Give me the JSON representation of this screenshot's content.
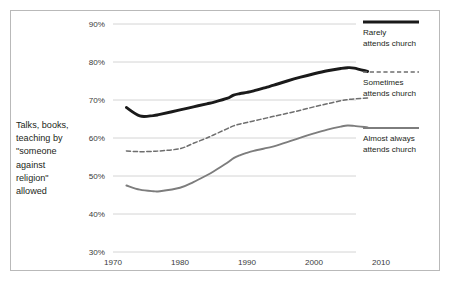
{
  "chart_data": {
    "type": "line",
    "title": "",
    "ylabel": "Talks, books, teaching by \"someone against religion\" allowed",
    "ylabel_lines": [
      "Talks, books,",
      "teaching by",
      "\"someone",
      "against",
      "religion\"",
      "allowed"
    ],
    "xlabel": "",
    "xlim": [
      1970,
      2010
    ],
    "ylim": [
      30,
      90
    ],
    "ytick_labels": [
      "90%",
      "80%",
      "70%",
      "60%",
      "50%",
      "40%",
      "30%"
    ],
    "ytick_values": [
      90,
      80,
      70,
      60,
      50,
      40,
      30
    ],
    "xtick_labels": [
      "1970",
      "1980",
      "1990",
      "2000",
      "2010"
    ],
    "xtick_values": [
      1970,
      1980,
      1990,
      2000,
      2010
    ],
    "grid": "horizontal",
    "legend_position": "right",
    "x": [
      1972,
      1974,
      1976,
      1977,
      1980,
      1982,
      1984,
      1985,
      1987,
      1988,
      1989,
      1990,
      1991,
      1993,
      1994,
      1996,
      1998,
      2000,
      2002,
      2004,
      2005,
      2006,
      2008
    ],
    "series": [
      {
        "name": "Rarely attends church",
        "style": "solid-thick",
        "color": "#1a1a1a",
        "values": [
          68.0,
          65.8,
          65.9,
          66.2,
          67.4,
          68.2,
          69.0,
          69.4,
          70.4,
          71.3,
          71.7,
          72.0,
          72.4,
          73.4,
          73.9,
          75.0,
          76.0,
          76.9,
          77.7,
          78.3,
          78.5,
          78.4,
          77.5
        ]
      },
      {
        "name": "Sometimes attends church",
        "style": "dashed",
        "color": "#6e6e6e",
        "values": [
          56.6,
          56.4,
          56.5,
          56.6,
          57.2,
          58.6,
          60.0,
          60.8,
          62.4,
          63.2,
          63.7,
          64.1,
          64.5,
          65.3,
          65.7,
          66.5,
          67.3,
          68.2,
          69.0,
          69.8,
          70.1,
          70.3,
          70.5
        ]
      },
      {
        "name": "Almost always attends church",
        "style": "solid",
        "color": "#7d7d7d",
        "values": [
          47.5,
          46.4,
          46.0,
          46.0,
          46.9,
          48.4,
          50.2,
          51.2,
          53.4,
          54.7,
          55.5,
          56.1,
          56.6,
          57.4,
          57.8,
          58.9,
          60.1,
          61.2,
          62.2,
          63.0,
          63.3,
          63.2,
          62.8
        ]
      }
    ]
  },
  "legend": {
    "items": [
      {
        "label_line1": "Rarely",
        "label_line2": "attends church"
      },
      {
        "label_line1": "Sometimes",
        "label_line2": "attends church"
      },
      {
        "label_line1": "Almost always",
        "label_line2": "attends church"
      }
    ]
  },
  "colors": {
    "frame": "#b9b9b9",
    "grid": "#cfcfcf",
    "series_dark": "#1a1a1a",
    "series_dashed": "#6e6e6e",
    "series_gray": "#7d7d7d",
    "text": "#231f20"
  }
}
